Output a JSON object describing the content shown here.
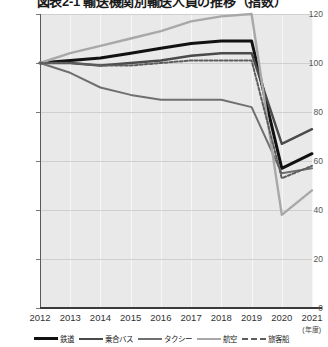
{
  "chart": {
    "title": "図表2-1 輸送機関別輸送人員の推移（指数）",
    "x_unit_note": "(年度)"
  },
  "axis": {
    "y_ticks": [
      "0",
      "20",
      "40",
      "60",
      "80",
      "100",
      "120"
    ],
    "x_ticks": [
      "2012",
      "2013",
      "2014",
      "2015",
      "2016",
      "2017",
      "2018",
      "2019",
      "2020",
      "2021"
    ]
  },
  "legend": {
    "items": [
      {
        "label": "鉄道",
        "color": "#111111",
        "width": 3.0,
        "dash": "none"
      },
      {
        "label": "乗合バス",
        "color": "#4a4a4a",
        "width": 2.4,
        "dash": "none"
      },
      {
        "label": "タクシー",
        "color": "#6f6f6f",
        "width": 2.0,
        "dash": "none"
      },
      {
        "label": "航空",
        "color": "#a8a8a8",
        "width": 2.4,
        "dash": "none"
      },
      {
        "label": "旅客船",
        "color": "#5e5e5e",
        "width": 2.0,
        "dash": "dashed"
      }
    ]
  },
  "chart_data": {
    "type": "line",
    "title": "図表2-1 輸送機関別輸送人員の推移（指数）",
    "xlabel": "(年度)",
    "ylabel": "",
    "x": [
      "2012",
      "2013",
      "2014",
      "2015",
      "2016",
      "2017",
      "2018",
      "2019",
      "2020",
      "2021"
    ],
    "ylim": [
      0,
      120
    ],
    "yticks": [
      0,
      20,
      40,
      60,
      80,
      100,
      120
    ],
    "grid": true,
    "legend_position": "bottom",
    "series": [
      {
        "name": "鉄道",
        "color": "#111111",
        "values": [
          100,
          101,
          102,
          104,
          106,
          108,
          109,
          109,
          57,
          63
        ]
      },
      {
        "name": "乗合バス",
        "color": "#4a4a4a",
        "values": [
          100,
          100,
          99,
          100,
          101,
          103,
          104,
          104,
          67,
          73
        ]
      },
      {
        "name": "タクシー",
        "color": "#6f6f6f",
        "values": [
          100,
          96,
          90,
          87,
          85,
          85,
          85,
          82,
          55,
          57
        ]
      },
      {
        "name": "航空",
        "color": "#a8a8a8",
        "values": [
          100,
          104,
          107,
          110,
          113,
          117,
          119,
          120,
          38,
          48
        ]
      },
      {
        "name": "旅客船",
        "color": "#5e5e5e",
        "values": [
          100,
          100,
          99,
          99,
          100,
          101,
          101,
          101,
          53,
          58
        ]
      }
    ]
  }
}
